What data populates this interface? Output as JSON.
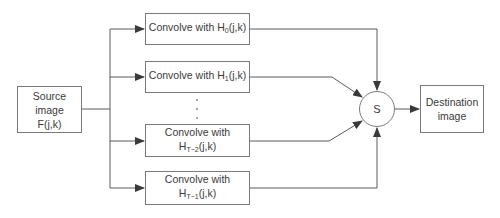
{
  "source": {
    "line1": "Source image",
    "line2": "F(j,k)"
  },
  "filters": [
    {
      "prefix": "Convolve with H",
      "sub": "0",
      "suffix": "(j,k)"
    },
    {
      "prefix": "Convolve with H",
      "sub": "1",
      "suffix": "(j,k)"
    },
    {
      "prefix": "Convolve with H",
      "sub": "T−2",
      "suffix": "(j,k)"
    },
    {
      "prefix": "Convolve with H",
      "sub": "T−1",
      "suffix": "(j,k)"
    }
  ],
  "summer": {
    "label": "S"
  },
  "destination": {
    "line1": "Destination",
    "line2": "image"
  },
  "colors": {
    "line": "#5a5a5a",
    "border": "#7a7a7a",
    "text": "#3a3a3a"
  }
}
